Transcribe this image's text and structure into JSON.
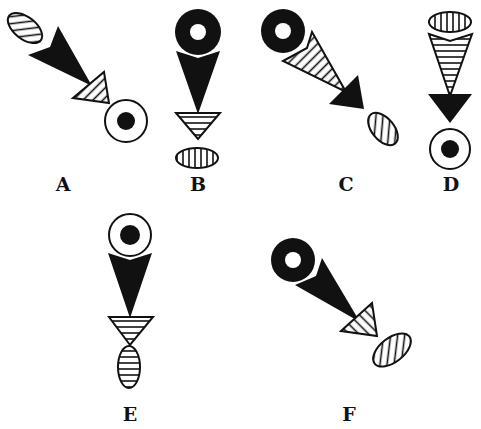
{
  "figure": {
    "type": "pattern-analogy-options",
    "colors": {
      "ink": "#111111",
      "background": "#ffffff"
    },
    "options": [
      {
        "label": "A",
        "orientation": "diagonal-down-right",
        "sequence_top_to_bottom": [
          "hatched-ellipse",
          "black-triangle",
          "hatched-triangle",
          "target-circle"
        ]
      },
      {
        "label": "B",
        "orientation": "vertical",
        "sequence_top_to_bottom": [
          "black-donut",
          "black-triangle",
          "hatched-triangle",
          "hatched-ellipse"
        ]
      },
      {
        "label": "C",
        "orientation": "diagonal-down-right",
        "sequence_top_to_bottom": [
          "black-donut",
          "hatched-triangle",
          "black-triangle",
          "hatched-ellipse"
        ]
      },
      {
        "label": "D",
        "orientation": "vertical",
        "sequence_top_to_bottom": [
          "hatched-ellipse",
          "hatched-triangle",
          "black-triangle",
          "target-circle"
        ]
      },
      {
        "label": "E",
        "orientation": "vertical",
        "sequence_top_to_bottom": [
          "target-circle",
          "black-triangle",
          "hatched-triangle",
          "hatched-ellipse"
        ]
      },
      {
        "label": "F",
        "orientation": "diagonal-down-right",
        "sequence_top_to_bottom": [
          "black-donut",
          "black-triangle",
          "hatched-triangle",
          "hatched-ellipse"
        ]
      }
    ]
  }
}
